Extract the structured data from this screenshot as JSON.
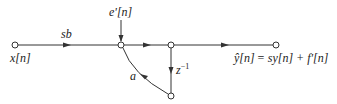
{
  "diagram": {
    "type": "signal-flow-graph",
    "labels": {
      "input": "x[n]",
      "input_gain": "sb",
      "noise_input": "e'[n]",
      "feedback_gain": "a",
      "delay": "z",
      "delay_exp": "−1",
      "output_lhs": "ŷ[n]",
      "output_eq": "= sy[n] + f'[n]"
    },
    "colors": {
      "line": "#333333",
      "text": "#222222",
      "background": "#ffffff"
    }
  }
}
